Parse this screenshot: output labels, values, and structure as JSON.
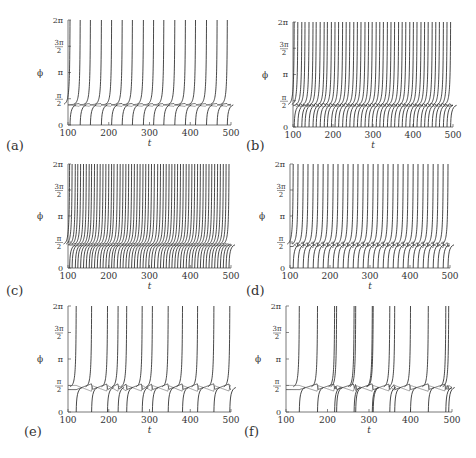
{
  "figure": {
    "panel_labels": [
      "(a)",
      "(b)",
      "(c)",
      "(d)",
      "(e)",
      "(f)"
    ],
    "xlabel": "t",
    "ylabel": "ϕ",
    "xticks": [
      "100",
      "200",
      "300",
      "400",
      "500"
    ],
    "yticks": [
      "0",
      "π/2",
      "π",
      "3π/2",
      "2π"
    ]
  },
  "chart_data": [
    {
      "panel": "(a)",
      "type": "line",
      "xlabel": "t",
      "ylabel": "ϕ",
      "xlim": [
        100,
        500
      ],
      "ylim": [
        0,
        6.283
      ],
      "yticks": [
        "0",
        "π/2",
        "π",
        "3π/2",
        "2π"
      ],
      "xticks": [
        100,
        200,
        300,
        400,
        500
      ],
      "baseline": 1.25,
      "ripple": 0.08,
      "spike_times": [
        105,
        130,
        155,
        182,
        207,
        233,
        258,
        285,
        310,
        335,
        362,
        388,
        413,
        440,
        466,
        491
      ],
      "description": "Regular periodic phase slips, one oscillator per period, locked plateau near pi/2 with small wavy oscillation"
    },
    {
      "panel": "(b)",
      "type": "line",
      "xlabel": "t",
      "ylabel": "ϕ",
      "xlim": [
        100,
        500
      ],
      "ylim": [
        0,
        6.283
      ],
      "yticks": [
        "0",
        "π/2",
        "π",
        "3π/2",
        "2π"
      ],
      "xticks": [
        100,
        200,
        300,
        400,
        500
      ],
      "baseline": 1.35,
      "ripple": 0.15,
      "spike_times": [
        103,
        112,
        122,
        130,
        140,
        150,
        158,
        168,
        178,
        186,
        196,
        205,
        214,
        224,
        233,
        242,
        252,
        261,
        270,
        280,
        289,
        298,
        308,
        317,
        326,
        336,
        345,
        354,
        364,
        373,
        382,
        392,
        401,
        410,
        420,
        429,
        438,
        448,
        457,
        466,
        476,
        485,
        494
      ],
      "description": "Dense irregular phase slips with plateau near pi/2"
    },
    {
      "panel": "(c)",
      "type": "line",
      "xlabel": "t",
      "ylabel": "ϕ",
      "xlim": [
        100,
        500
      ],
      "ylim": [
        0,
        6.283
      ],
      "yticks": [
        "0",
        "π/2",
        "π",
        "3π/2",
        "2π"
      ],
      "xticks": [
        100,
        200,
        300,
        400,
        500
      ],
      "baseline": 1.45,
      "ripple": 0.05,
      "spike_times": [
        104,
        110,
        118,
        124,
        131,
        138,
        145,
        152,
        158,
        165,
        172,
        179,
        186,
        193,
        200,
        207,
        213,
        221,
        228,
        235,
        242,
        249,
        256,
        263,
        270,
        277,
        284,
        291,
        298,
        305,
        312,
        320,
        327,
        334,
        341,
        348,
        355,
        362,
        369,
        376,
        383,
        390,
        397,
        404,
        411,
        418,
        425,
        432,
        439,
        446,
        453,
        460,
        467,
        474,
        481,
        488,
        495
      ],
      "description": "Very dense phase slips with a slowly drifting plateau resetting roughly every 100 time units"
    },
    {
      "panel": "(d)",
      "type": "line",
      "xlabel": "t",
      "ylabel": "ϕ",
      "xlim": [
        100,
        500
      ],
      "ylim": [
        0,
        6.283
      ],
      "yticks": [
        "0",
        "π/2",
        "π",
        "3π/2",
        "2π"
      ],
      "xticks": [
        100,
        200,
        300,
        400,
        500
      ],
      "baseline": 1.45,
      "ripple": 0.3,
      "spike_times": [
        108,
        120,
        133,
        145,
        158,
        170,
        183,
        195,
        208,
        220,
        233,
        245,
        258,
        270,
        283,
        295,
        308,
        320,
        333,
        345,
        358,
        370,
        383,
        395,
        408,
        420,
        433,
        445,
        458,
        470,
        483,
        495
      ],
      "description": "Regular paired phase slips with zig-zag plateau near pi/2"
    },
    {
      "panel": "(e)",
      "type": "line",
      "xlabel": "t",
      "ylabel": "ϕ",
      "xlim": [
        100,
        500
      ],
      "ylim": [
        0,
        6.283
      ],
      "yticks": [
        "0",
        "π/2",
        "π",
        "3π/2",
        "2π"
      ],
      "xticks": [
        100,
        200,
        300,
        400,
        500
      ],
      "baseline": 1.5,
      "ripple": 0.35,
      "spike_times": [
        120,
        158,
        197,
        223,
        244,
        282,
        307,
        346,
        381,
        418,
        458,
        497
      ],
      "description": "Sparse irregular phase slips with sawtooth plateau near pi/2"
    },
    {
      "panel": "(f)",
      "type": "line",
      "xlabel": "t",
      "ylabel": "ϕ",
      "xlim": [
        100,
        500
      ],
      "ylim": [
        0,
        6.283
      ],
      "yticks": [
        "0",
        "π/2",
        "π",
        "3π/2",
        "2π"
      ],
      "xticks": [
        100,
        200,
        300,
        400,
        500
      ],
      "baseline": 1.5,
      "ripple": 0.35,
      "spike_times": [
        132,
        176,
        217,
        222,
        264,
        268,
        308,
        310,
        350,
        362,
        400,
        443,
        485,
        492
      ],
      "description": "Sparse phase slips, sometimes doubled, with cusped plateau near pi/2"
    }
  ]
}
